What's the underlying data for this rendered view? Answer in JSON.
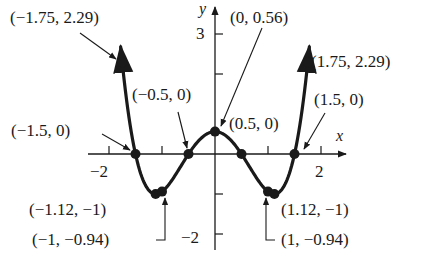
{
  "chart_data": {
    "type": "line",
    "title": "",
    "xlabel": "x",
    "ylabel": "y",
    "xlim": [
      -2.35,
      2.5
    ],
    "ylim": [
      -2.3,
      3.7
    ],
    "grid": false,
    "legend": null,
    "x_ticks": [
      -2,
      -1,
      0,
      1,
      2
    ],
    "x_tick_labels": [
      "-2",
      "",
      "",
      "",
      "2"
    ],
    "y_ticks": [
      -2,
      -1,
      2,
      3
    ],
    "y_tick_labels": [
      "-2",
      "",
      "",
      "3"
    ],
    "function": "f(x) = x^4 - 2.5x^2 + 0.56",
    "domain": [
      -1.78,
      1.78
    ],
    "series": [
      {
        "name": "curve",
        "x": [
          -1.75,
          -1.5,
          -1.12,
          -1,
          -0.5,
          0,
          0.5,
          1,
          1.12,
          1.5,
          1.75
        ],
        "y": [
          2.29,
          0,
          -1,
          -0.94,
          0,
          0.56,
          0,
          -0.94,
          -1,
          0,
          2.29
        ]
      }
    ],
    "annotations": [
      {
        "point": [
          -1.75,
          2.29
        ],
        "label": "(−1.75, 2.29)"
      },
      {
        "point": [
          1.75,
          2.29
        ],
        "label": "(1.75, 2.29)"
      },
      {
        "point": [
          0,
          0.56
        ],
        "label": "(0, 0.56)"
      },
      {
        "point": [
          -1.5,
          0
        ],
        "label": "(−1.5, 0)"
      },
      {
        "point": [
          1.5,
          0
        ],
        "label": "(1.5, 0)"
      },
      {
        "point": [
          -0.5,
          0
        ],
        "label": "(−0.5, 0)"
      },
      {
        "point": [
          0.5,
          0
        ],
        "label": "(0.5, 0)"
      },
      {
        "point": [
          -1.12,
          -1
        ],
        "label": "(−1.12, −1)"
      },
      {
        "point": [
          1.12,
          -1
        ],
        "label": "(1.12, −1)"
      },
      {
        "point": [
          -1,
          -0.94
        ],
        "label": "(−1, −0.94)"
      },
      {
        "point": [
          1,
          -0.94
        ],
        "label": "(1, −0.94)"
      }
    ]
  },
  "labels": {
    "x_axis": "x",
    "y_axis": "y",
    "tick_x_neg2": "−2",
    "tick_x_2": "2",
    "tick_y_3": "3",
    "tick_y_neg2": "−2",
    "pt_neg175": "(−1.75, 2.29)",
    "pt_pos175": "(1.75, 2.29)",
    "pt_0": "(0, 0.56)",
    "pt_neg15": "(−1.5, 0)",
    "pt_pos15": "(1.5, 0)",
    "pt_neg05": "(−0.5, 0)",
    "pt_pos05": "(0.5, 0)",
    "pt_neg112": "(−1.12, −1)",
    "pt_pos112": "(1.12, −1)",
    "pt_neg1": "(−1, −0.94)",
    "pt_pos1": "(1, −0.94)"
  },
  "colors": {
    "ink": "#1a1a1a",
    "background": "#ffffff"
  }
}
